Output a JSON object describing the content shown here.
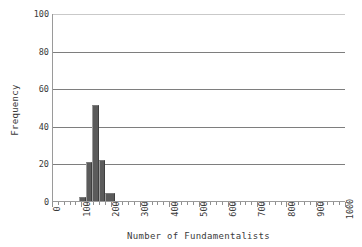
{
  "chart_data": {
    "type": "bar",
    "title": "",
    "subtitle": "",
    "xlabel": "Number of Fundamentalists",
    "ylabel": "Frequency",
    "xlim": [
      0,
      1000
    ],
    "ylim": [
      0,
      100
    ],
    "grid": true,
    "legend": false,
    "legend_position": "none",
    "x_tick_labels": [
      "0",
      "100",
      "200",
      "300",
      "400",
      "500",
      "600",
      "700",
      "800",
      "900",
      "1000"
    ],
    "x_tick_values": [
      0,
      100,
      200,
      300,
      400,
      500,
      600,
      700,
      800,
      900,
      1000
    ],
    "x_minor_tick_step": 20,
    "y_tick_labels": [
      "0",
      "20",
      "40",
      "60",
      "80",
      "100"
    ],
    "y_tick_values": [
      0,
      20,
      40,
      60,
      80,
      100
    ],
    "bar_color": "#5b5b5b",
    "grid_color": "#7e7e7e",
    "axis_color": "#9a9a9a",
    "background_color": "#ffffff",
    "bins": [
      {
        "x_start": 90,
        "x_end": 112,
        "value": 2
      },
      {
        "x_start": 112,
        "x_end": 134,
        "value": 21
      },
      {
        "x_start": 134,
        "x_end": 156,
        "value": 51
      },
      {
        "x_start": 156,
        "x_end": 178,
        "value": 22
      },
      {
        "x_start": 178,
        "x_end": 210,
        "value": 4
      }
    ],
    "categories": [
      101,
      123,
      145,
      167,
      194
    ],
    "values": [
      2,
      21,
      51,
      22,
      4
    ]
  }
}
